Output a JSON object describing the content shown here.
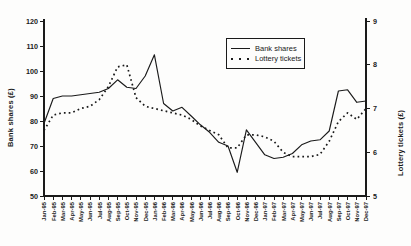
{
  "chart_data": {
    "type": "line",
    "title": "",
    "categories": [
      "Jan-95",
      "Feb-95",
      "Mar-95",
      "Apr-95",
      "May-95",
      "Jun-95",
      "Jul-95",
      "Aug-95",
      "Sep-95",
      "Oct-95",
      "Nov-95",
      "Dec-95",
      "Jan-96",
      "Feb-96",
      "Mar-96",
      "Apr-96",
      "May-96",
      "Jun-96",
      "Jul-96",
      "Aug-96",
      "Sep-96",
      "Oct-96",
      "Nov-96",
      "Dec-96",
      "Jan-97",
      "Feb-97",
      "Mar-97",
      "Apr-97",
      "May-97",
      "Jun-97",
      "Jul-97",
      "Aug-97",
      "Sep-97",
      "Oct-97",
      "Nov-97",
      "Dec-97"
    ],
    "series": [
      {
        "name": "Bank shares",
        "axis": "left",
        "style": "solid",
        "values": [
          79,
          89,
          90,
          90,
          90.5,
          91,
          91.5,
          93,
          96.5,
          93.5,
          93,
          98,
          106.5,
          87,
          84,
          85.5,
          82,
          78.5,
          75.5,
          71.5,
          70,
          59.5,
          76.5,
          71.5,
          66.5,
          65,
          65.5,
          67,
          70.5,
          72,
          72.5,
          76,
          92,
          92.5,
          87.5,
          88
        ]
      },
      {
        "name": "Lottery tickets",
        "axis": "right",
        "style": "dotted",
        "values": [
          6.5,
          6.85,
          6.9,
          6.9,
          7.0,
          7.05,
          7.2,
          7.5,
          7.95,
          8.0,
          7.25,
          7.05,
          7.0,
          6.95,
          6.9,
          6.85,
          6.75,
          6.6,
          6.5,
          6.4,
          6.1,
          6.1,
          6.4,
          6.4,
          6.35,
          6.25,
          6.0,
          5.9,
          5.9,
          5.9,
          5.95,
          6.25,
          6.7,
          6.9,
          6.75,
          7.0
        ]
      }
    ],
    "ylabel_left": "Bank shares (£)",
    "ylabel_right": "Lottery tickets (£)",
    "y_left": {
      "min": 50,
      "max": 120,
      "ticks": [
        50,
        60,
        70,
        80,
        90,
        100,
        110,
        120
      ]
    },
    "y_right": {
      "min": 5,
      "max": 9,
      "ticks": [
        5,
        6,
        7,
        8,
        9
      ]
    },
    "xlabel": "",
    "grid": false,
    "legend_position": "inside-top-right",
    "line_color": "#1a1a1a",
    "background_color": "#fdfdfc"
  }
}
